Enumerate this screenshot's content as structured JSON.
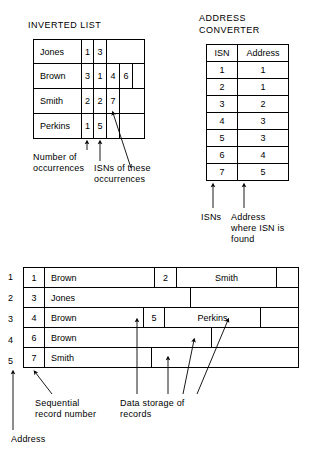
{
  "inverted_list": {
    "title": "INVERTED LIST",
    "rows": [
      {
        "name": "Jones",
        "count": "1",
        "isns": [
          "3"
        ]
      },
      {
        "name": "Brown",
        "count": "3",
        "isns": [
          "1",
          "4",
          "6"
        ]
      },
      {
        "name": "Smith",
        "count": "2",
        "isns": [
          "2",
          "7"
        ]
      },
      {
        "name": "Perkins",
        "count": "1",
        "isns": [
          "5"
        ]
      }
    ],
    "annotations": {
      "count_label": "Number of\noccurrences",
      "isn_label": "ISNs of these\noccurrences"
    }
  },
  "address_converter": {
    "title": "ADDRESS\nCONVERTER",
    "columns": [
      "ISN",
      "Address"
    ],
    "rows": [
      {
        "isn": "1",
        "address": "1"
      },
      {
        "isn": "2",
        "address": "1"
      },
      {
        "isn": "3",
        "address": "2"
      },
      {
        "isn": "4",
        "address": "3"
      },
      {
        "isn": "5",
        "address": "3"
      },
      {
        "isn": "6",
        "address": "4"
      },
      {
        "isn": "7",
        "address": "5"
      }
    ],
    "annotations": {
      "isns_label": "ISNs",
      "address_label": "Address\nwhere ISN is\nfound"
    }
  },
  "data_storage": {
    "addresses": [
      "1",
      "2",
      "3",
      "4",
      "5"
    ],
    "rows": [
      {
        "address": "1",
        "records": [
          {
            "seq": "1",
            "name": "Brown"
          },
          {
            "seq": "2",
            "name": "Smith"
          }
        ]
      },
      {
        "address": "2",
        "records": [
          {
            "seq": "3",
            "name": "Jones"
          }
        ]
      },
      {
        "address": "3",
        "records": [
          {
            "seq": "4",
            "name": "Brown"
          },
          {
            "seq": "5",
            "name": "Perkins"
          }
        ]
      },
      {
        "address": "4",
        "records": [
          {
            "seq": "6",
            "name": "Brown"
          }
        ]
      },
      {
        "address": "5",
        "records": [
          {
            "seq": "7",
            "name": "Smith"
          }
        ]
      }
    ],
    "annotations": {
      "address_label": "Address",
      "seq_label": "Sequential\nrecord number",
      "data_label": "Data storage of\nrecords"
    }
  },
  "colors": {
    "line": "#000000",
    "background": "#ffffff",
    "text": "#000000"
  }
}
